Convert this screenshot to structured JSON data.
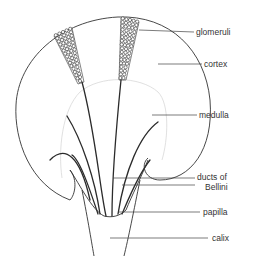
{
  "diagram": {
    "labels": [
      {
        "id": "glomeruli",
        "text": "glomeruli",
        "x": 196,
        "y": 35
      },
      {
        "id": "cortex",
        "text": "cortex",
        "x": 204,
        "y": 67
      },
      {
        "id": "medulla",
        "text": "medulla",
        "x": 199,
        "y": 118
      },
      {
        "id": "ducts-of-bellini-1",
        "text": "ducts of",
        "x": 197,
        "y": 180
      },
      {
        "id": "ducts-of-bellini-2",
        "text": "Bellini",
        "x": 205,
        "y": 190
      },
      {
        "id": "papilla",
        "text": "papilla",
        "x": 203,
        "y": 215
      },
      {
        "id": "calix",
        "text": "calix",
        "x": 212,
        "y": 241
      }
    ],
    "caption": "",
    "colors": {
      "line": "#333333",
      "faint": "#d8d8d8",
      "background": "#ffffff"
    }
  }
}
